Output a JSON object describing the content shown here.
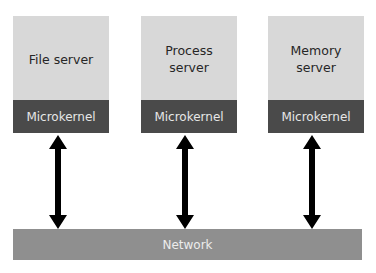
{
  "diagram": {
    "servers": [
      {
        "label": "File server",
        "kernel_label": "Microkernel"
      },
      {
        "label": "Process\nserver",
        "kernel_label": "Microkernel"
      },
      {
        "label": "Memory\nserver",
        "kernel_label": "Microkernel"
      }
    ],
    "network": {
      "label": "Network"
    },
    "connections": [
      {
        "from": "File server",
        "to": "Network",
        "type": "bidirectional-arrow"
      },
      {
        "from": "Process server",
        "to": "Network",
        "type": "bidirectional-arrow"
      },
      {
        "from": "Memory server",
        "to": "Network",
        "type": "bidirectional-arrow"
      }
    ],
    "colors": {
      "server_fill": "#d8d8d8",
      "kernel_fill": "#4a4a4a",
      "network_fill": "#8f8f8f",
      "arrow": "#000000"
    }
  }
}
